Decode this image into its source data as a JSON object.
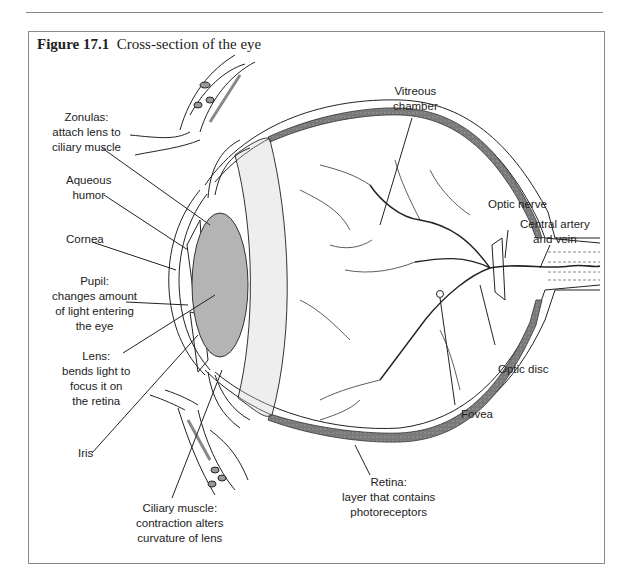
{
  "figure": {
    "number_label": "Figure 17.1",
    "title": "Cross-section of the eye"
  },
  "labels": {
    "zonulas": [
      "Zonulas:",
      "attach lens to",
      "ciliary muscle"
    ],
    "aqueous_humor": [
      "Aqueous",
      "humor"
    ],
    "cornea": [
      "Cornea"
    ],
    "pupil": [
      "Pupil:",
      "changes amount",
      "of light entering",
      "the eye"
    ],
    "lens": [
      "Lens:",
      "bends light to",
      "focus it on",
      "the retina"
    ],
    "iris": [
      "Iris"
    ],
    "ciliary_muscle": [
      "Ciliary muscle:",
      "contraction alters",
      "curvature of lens"
    ],
    "vitreous_chamber": [
      "Vitreous",
      "chamber"
    ],
    "optic_nerve": [
      "Optic nerve"
    ],
    "central_artery_vein": [
      "Central artery",
      "and vein"
    ],
    "optic_disc": [
      "Optic disc"
    ],
    "fovea": [
      "Fovea"
    ],
    "retina": [
      "Retina:",
      "layer that contains",
      "photoreceptors"
    ]
  },
  "colors": {
    "line": "#222222",
    "lens_fill": "#b4b4b4",
    "retina_fill": "#6e6e6e",
    "border": "#8a8a8a"
  }
}
